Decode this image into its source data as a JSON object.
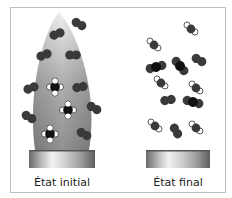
{
  "diagram": {
    "panels": [
      {
        "id": "initial",
        "label": "État initial",
        "flame": true,
        "molecules": [
          {
            "type": "O2",
            "x": 79,
            "y": 24,
            "angle": 30
          },
          {
            "type": "O2",
            "x": 57,
            "y": 34,
            "angle": -20
          },
          {
            "type": "O2",
            "x": 44,
            "y": 55,
            "angle": -20
          },
          {
            "type": "O2",
            "x": 73,
            "y": 55,
            "angle": 0
          },
          {
            "type": "O2",
            "x": 31,
            "y": 88,
            "angle": -20
          },
          {
            "type": "O2",
            "x": 80,
            "y": 87,
            "angle": -10
          },
          {
            "type": "O2",
            "x": 29,
            "y": 117,
            "angle": 30
          },
          {
            "type": "O2",
            "x": 94,
            "y": 108,
            "angle": 30
          },
          {
            "type": "O2",
            "x": 84,
            "y": 134,
            "angle": 30
          },
          {
            "type": "CH4",
            "x": 55,
            "y": 87
          },
          {
            "type": "CH4",
            "x": 68,
            "y": 110
          },
          {
            "type": "CH4",
            "x": 50,
            "y": 134
          }
        ],
        "burner": {
          "x": 29,
          "y": 150,
          "w": 66,
          "h": 18
        }
      },
      {
        "id": "final",
        "label": "État final",
        "flame": false,
        "molecules": [
          {
            "type": "H2O",
            "x": 191,
            "y": 29
          },
          {
            "type": "H2O",
            "x": 154,
            "y": 45
          },
          {
            "type": "CO2",
            "x": 156,
            "y": 67,
            "angle": -15
          },
          {
            "type": "CO2",
            "x": 180,
            "y": 66,
            "angle": 50
          },
          {
            "type": "O2",
            "x": 199,
            "y": 60,
            "angle": 30
          },
          {
            "type": "H2O",
            "x": 161,
            "y": 83
          },
          {
            "type": "H2O",
            "x": 196,
            "y": 88
          },
          {
            "type": "O2",
            "x": 168,
            "y": 100,
            "angle": -10
          },
          {
            "type": "CO2",
            "x": 193,
            "y": 102,
            "angle": 15
          },
          {
            "type": "H2O",
            "x": 155,
            "y": 126
          },
          {
            "type": "O2",
            "x": 176,
            "y": 131,
            "angle": 60
          },
          {
            "type": "H2O",
            "x": 196,
            "y": 128
          }
        ],
        "burner": {
          "x": 146,
          "y": 150,
          "w": 64,
          "h": 18
        }
      }
    ],
    "colors": {
      "atom_dark": "#3a3a3a",
      "atom_carbon": "#111111",
      "atom_white": "#ffffff",
      "flame_top": "#e8e8e8",
      "flame_bottom": "#8a8a8a",
      "frame_border": "#bdbdbd"
    }
  }
}
